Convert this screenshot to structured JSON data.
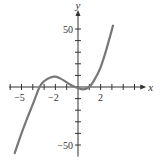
{
  "chart_data": {
    "type": "line",
    "title": "",
    "xlabel": "x",
    "ylabel": "y",
    "xlim": [
      -6,
      5.5
    ],
    "ylim": [
      -60,
      60
    ],
    "x_minor_tick_step": 1,
    "y_minor_tick_step": 10,
    "x_tick_labels": [
      {
        "value": -5,
        "label": "-5"
      },
      {
        "value": -2,
        "label": "-2"
      },
      {
        "value": 2,
        "label": "2"
      }
    ],
    "y_tick_labels": [
      {
        "value": 50,
        "label": "50"
      },
      {
        "value": -50,
        "label": "-50"
      }
    ],
    "grid": false,
    "series": [
      {
        "name": "f(x)",
        "color": "#777777",
        "points": [
          [
            -5.6,
            -57
          ],
          [
            -5,
            -40
          ],
          [
            -4.5,
            -27
          ],
          [
            -4,
            -15
          ],
          [
            -3.4,
            0
          ],
          [
            -3,
            5
          ],
          [
            -2.5,
            8
          ],
          [
            -2,
            9
          ],
          [
            -1.5,
            7
          ],
          [
            -1,
            4
          ],
          [
            -0.5,
            1
          ],
          [
            0,
            -1
          ],
          [
            0.5,
            -2
          ],
          [
            1,
            0
          ],
          [
            1.5,
            7
          ],
          [
            2,
            17
          ],
          [
            2.5,
            32
          ],
          [
            3.1,
            53
          ]
        ]
      }
    ]
  }
}
